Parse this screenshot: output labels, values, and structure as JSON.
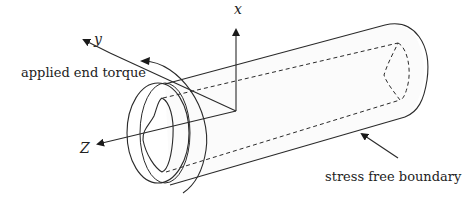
{
  "figure": {
    "title": "",
    "labels": {
      "x_axis": "x",
      "y_axis": "y",
      "z_axis": "Z",
      "torque": "applied end torque",
      "boundary": "stress free boundary"
    },
    "colors": {
      "line": "#2a2a2a",
      "fill": "#fbfbfb",
      "background": "#ffffff"
    },
    "elements": [
      "hollow cylinder (tube) with irregular inner cross-section",
      "coordinate axes x, y, Z at front end",
      "curved arrow indicating applied end torque",
      "arrow pointing to outer surface: stress free boundary"
    ]
  }
}
